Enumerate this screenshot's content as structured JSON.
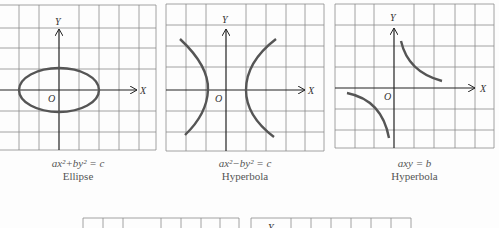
{
  "panels": [
    {
      "id": "ellipse",
      "axis_labels": {
        "x": "X",
        "y": "Y",
        "origin": "O"
      },
      "equation": "ax²+by² = c",
      "name": "Ellipse"
    },
    {
      "id": "hyperbola-1",
      "axis_labels": {
        "x": "X",
        "y": "Y",
        "origin": "O"
      },
      "equation": "ax²−by² = c",
      "name": "Hyperbola"
    },
    {
      "id": "hyperbola-2",
      "axis_labels": {
        "x": "X",
        "y": "Y",
        "origin": "O"
      },
      "equation": "axy = b",
      "name": "Hyperbola"
    },
    {
      "id": "partial-bottom-left",
      "axis_labels": {}
    },
    {
      "id": "partial-bottom-right",
      "axis_labels": {
        "y": "Y"
      }
    }
  ],
  "colors": {
    "grid": "#8a8a8a",
    "axis": "#222222",
    "curve": "#555555",
    "background": "#fdfdfd"
  }
}
